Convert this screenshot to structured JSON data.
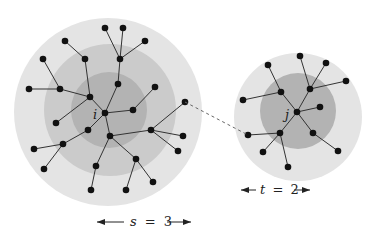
{
  "colors": {
    "outer_ring": "#e4e4e4",
    "middle_ring": "#cbcbcb",
    "inner_ring": "#b3b3b3",
    "edge": "#333333",
    "node": "#111111",
    "dashed_link": "#666666"
  },
  "left_cluster": {
    "center_label": "i",
    "scale_label_var": "s",
    "scale_label_eq": "=",
    "scale_label_val": "3",
    "scale_label": "s = 3"
  },
  "right_cluster": {
    "center_label": "j",
    "scale_label_var": "t",
    "scale_label_eq": "=",
    "scale_label_val": "2",
    "scale_label": "t = 2"
  }
}
